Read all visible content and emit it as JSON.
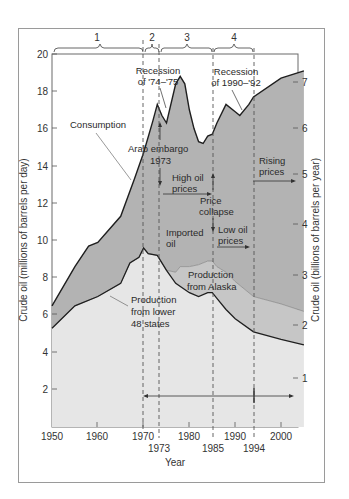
{
  "chart_data": {
    "type": "area",
    "title": "",
    "xlabel": "Year",
    "ylabel": "Crude oil (millions of barrels per day)",
    "y2label": "Crude oil (billions of barrels per year)",
    "xlim": [
      1950,
      2005
    ],
    "ylim": [
      0,
      20
    ],
    "y2lim": [
      0,
      7.3
    ],
    "x_ticks": [
      1950,
      1960,
      1970,
      1980,
      1990,
      2000
    ],
    "x_extra_ticks": [
      1973,
      1985,
      1994
    ],
    "y_ticks": [
      2,
      4,
      6,
      8,
      10,
      12,
      14,
      16,
      18,
      20
    ],
    "y2_ticks": [
      1,
      2,
      3,
      4,
      5,
      6,
      7
    ],
    "grid": false,
    "series": [
      {
        "name": "Consumption",
        "x": [
          1950,
          1955,
          1958,
          1960,
          1965,
          1968,
          1970,
          1972,
          1973,
          1974,
          1975,
          1977,
          1978,
          1979,
          1980,
          1981,
          1982,
          1983,
          1984,
          1985,
          1986,
          1988,
          1990,
          1991,
          1993,
          1994,
          2000,
          2005
        ],
        "values": [
          6.5,
          8.6,
          9.7,
          9.9,
          11.3,
          13.3,
          14.7,
          16.4,
          17.3,
          16.7,
          16.3,
          18.4,
          18.8,
          18.4,
          17.0,
          16.0,
          15.3,
          15.2,
          15.6,
          15.7,
          16.3,
          17.3,
          16.9,
          16.7,
          17.3,
          17.7,
          18.7,
          19.1
        ]
      },
      {
        "name": "Production (lower 48 + Alaska)",
        "x": [
          1950,
          1955,
          1960,
          1965,
          1967,
          1969,
          1970,
          1971,
          1973,
          1975,
          1977,
          1978,
          1980,
          1982,
          1984,
          1985,
          1986,
          1988,
          1990,
          1994,
          2000,
          2005
        ],
        "values": [
          5.3,
          6.5,
          7.0,
          7.7,
          8.8,
          9.1,
          9.6,
          9.3,
          9.2,
          8.4,
          8.3,
          8.6,
          8.6,
          8.7,
          8.9,
          8.9,
          8.6,
          8.3,
          7.8,
          7.0,
          6.6,
          6.2
        ]
      },
      {
        "name": "Production from lower 48 states",
        "x": [
          1950,
          1955,
          1960,
          1965,
          1967,
          1969,
          1970,
          1971,
          1973,
          1975,
          1977,
          1980,
          1982,
          1984,
          1985,
          1986,
          1988,
          1990,
          1994,
          2000,
          2005
        ],
        "values": [
          5.3,
          6.5,
          7.0,
          7.7,
          8.8,
          9.1,
          9.6,
          9.3,
          9.2,
          8.4,
          7.7,
          7.2,
          7.0,
          7.2,
          7.2,
          6.9,
          6.3,
          5.8,
          5.1,
          4.7,
          4.4
        ]
      }
    ],
    "periods": [
      {
        "label": "1",
        "from": 1950,
        "to": 1970
      },
      {
        "label": "2",
        "from": 1970,
        "to": 1973
      },
      {
        "label": "3",
        "from": 1973,
        "to": 1985
      },
      {
        "label": "4",
        "from": 1985,
        "to": 1994
      }
    ],
    "reference_lines": [
      1970,
      1973,
      1985,
      1994
    ],
    "annotations": [
      {
        "text": "Recession of '74–'75"
      },
      {
        "text": "Recession of 1990–'92"
      },
      {
        "text": "Consumption"
      },
      {
        "text": "Arab embargo 1973"
      },
      {
        "text": "High oil prices"
      },
      {
        "text": "Price collapse"
      },
      {
        "text": "Low oil prices"
      },
      {
        "text": "Imported oil"
      },
      {
        "text": "Rising prices"
      },
      {
        "text": "Production from Alaska"
      },
      {
        "text": "Production from lower 48 states"
      }
    ]
  },
  "labels": {
    "period_1": "1",
    "period_2": "2",
    "period_3": "3",
    "period_4": "4",
    "recession_7475_l1": "Recession",
    "recession_7475_l2": "of '74–'75",
    "recession_9092_l1": "Recession",
    "recession_9092_l2": "of 1990–'92",
    "consumption": "Consumption",
    "embargo_l1": "Arab embargo",
    "embargo_l2": "1973",
    "high_prices_l1": "High oil",
    "high_prices_l2": "prices",
    "collapse_l1": "Price",
    "collapse_l2": "collapse",
    "low_prices_l1": "Low oil",
    "low_prices_l2": "prices",
    "imported_l1": "Imported",
    "imported_l2": "oil",
    "rising_l1": "Rising",
    "rising_l2": "prices",
    "alaska_l1": "Production",
    "alaska_l2": "from  Alaska",
    "lower48_l1": "Production",
    "lower48_l2": "from lower",
    "lower48_l3": "48 states",
    "x_title": "Year",
    "y_title": "Crude oil (millions of barrels per day)",
    "y2_title": "Crude oil (billions of barrels per year)",
    "x_1950": "1950",
    "x_1960": "1960",
    "x_1970": "1970",
    "x_1980": "1980",
    "x_1990": "1990",
    "x_2000": "2000",
    "x_1973": "1973",
    "x_1985": "1985",
    "x_1994": "1994",
    "y_2": "2",
    "y_4": "4",
    "y_6": "6",
    "y_8": "8",
    "y_10": "10",
    "y_12": "12",
    "y_14": "14",
    "y_16": "16",
    "y_18": "18",
    "y_20": "20",
    "y2_1": "1",
    "y2_2": "2",
    "y2_3": "3",
    "y2_4": "4",
    "y2_5": "5",
    "y2_6": "6",
    "y2_7": "7"
  },
  "colors": {
    "imported_fill": "#b3b3b3",
    "alaska_fill": "#c6c6c6",
    "lower48_fill": "#e6e6e6",
    "line": "#1f1f1f",
    "frame": "#9a9a9a"
  }
}
